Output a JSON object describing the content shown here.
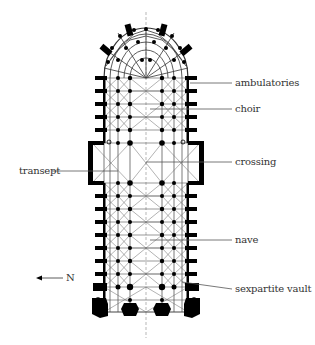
{
  "diagram": {
    "labels": {
      "ambulatories": "ambulatories",
      "choir": "choir",
      "transept": "transept",
      "crossing": "crossing",
      "nave": "nave",
      "sexpartite_vault": "sexpartite vault"
    },
    "compass": {
      "arrow_icon": "arrow-left-icon",
      "direction": "N"
    },
    "colors": {
      "ink": "#000000",
      "line": "#555555",
      "text": "#333333",
      "background": "#ffffff"
    }
  }
}
